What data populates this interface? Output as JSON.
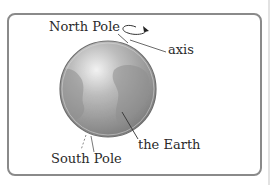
{
  "diagram": {
    "labels": {
      "north_pole": "North Pole",
      "axis": "axis",
      "earth": "the Earth",
      "south_pole": "South Pole"
    },
    "icons": {
      "rotation_arrow": "rotation-arrow-icon",
      "globe": "earth-globe"
    },
    "colors": {
      "frame_border": "#8a8a8a",
      "globe_light": "#e6e6e6",
      "globe_mid": "#a9a9a9",
      "globe_dark": "#7d7d7d",
      "text": "#2a2a2a",
      "leader_line": "#3a3a3a"
    }
  }
}
